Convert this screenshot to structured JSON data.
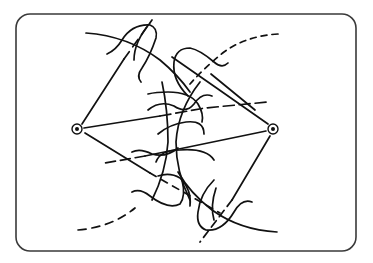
{
  "diagram": {
    "colors": {
      "background": "#ffffff",
      "ink": "#111111",
      "frame": "#3a3a3a"
    },
    "frame": {
      "x": 16,
      "y": 14,
      "width": 340,
      "height": 237,
      "radius": 14
    },
    "pivots": [
      {
        "name": "left-pivot",
        "cx": 77,
        "cy": 129,
        "r_outer": 5,
        "r_inner": 2
      },
      {
        "name": "right-pivot",
        "cx": 273,
        "cy": 129,
        "r_outer": 5,
        "r_inner": 2
      }
    ],
    "lines": [
      {
        "name": "left-upper-radial",
        "d": "M82,124 L124,59",
        "dash": ""
      },
      {
        "name": "left-upper-radial-dashed",
        "d": "M124,59 L152,20",
        "dash": "9 6"
      },
      {
        "name": "left-middle-radial",
        "d": "M84,128 L160,116",
        "dash": ""
      },
      {
        "name": "left-middle-radial-dashed",
        "d": "M160,116 L205,108 L268,102",
        "dash": "11 5"
      },
      {
        "name": "left-lower-radial",
        "d": "M85,133 L150,173",
        "dash": ""
      },
      {
        "name": "left-lower-radial-dashed",
        "d": "M150,173 L220,213",
        "dash": "7 6"
      },
      {
        "name": "right-upper-radial",
        "d": "M268,124 L218,89 L172,57",
        "dash": ""
      },
      {
        "name": "right-middle-radial",
        "d": "M266,131 L145,156",
        "dash": ""
      },
      {
        "name": "right-middle-radial-dashed",
        "d": "M145,156 L105,163",
        "dash": "10 5"
      },
      {
        "name": "right-lower-radial",
        "d": "M270,136 L232,200",
        "dash": ""
      },
      {
        "name": "right-lower-radial-dashed",
        "d": "M232,200 L200,242",
        "dash": "8 5"
      },
      {
        "name": "right-extra-diagonal",
        "d": "M255,110 L211,74",
        "dash": ""
      }
    ],
    "arcs": [
      {
        "name": "left-top-arc",
        "d": "M86,33 Q128,36 160,60 Q178,75 190,92",
        "dash": ""
      },
      {
        "name": "left-bottom-arc",
        "d": "M78,230 Q112,227 135,208",
        "dash": "8 6"
      },
      {
        "name": "right-top-arc",
        "d": "M278,34 Q246,36 224,52 Q204,68 190,84",
        "dash": "6 5"
      },
      {
        "name": "right-bottom-arc",
        "d": "M277,232 Q240,230 212,210 Q190,193 178,172",
        "dash": ""
      },
      {
        "name": "center-arc-down-left",
        "d": "M162,82 Q168,110 168,142 Q166,172 152,200",
        "dash": ""
      },
      {
        "name": "center-arc-down-right",
        "d": "M200,82 Q178,110 176,142 Q176,172 190,200",
        "dash": ""
      }
    ],
    "waves": [
      {
        "name": "upper-left-hook",
        "d": "M107,54 Q116,50 122,40 Q132,24 150,25 Q158,28 156,38 Q150,56 142,68 Q136,76 141,82",
        "dash": ""
      },
      {
        "name": "upper-left-hook-2",
        "d": "M150,23 Q134,42 134,60",
        "dash": ""
      },
      {
        "name": "upper-right-hook",
        "d": "M228,63 Q222,69 214,62 Q200,50 190,48 Q176,48 174,62 Q172,80 188,96",
        "dash": ""
      },
      {
        "name": "center-wave-1",
        "d": "M148,94 Q156,92 168,92 Q190,92 198,104 Q204,114 202,122",
        "dash": ""
      },
      {
        "name": "center-wave-2",
        "d": "M158,134 Q170,124 186,122 Q204,120 204,134",
        "dash": ""
      },
      {
        "name": "center-wave-3",
        "d": "M156,162 Q160,150 180,150 Q206,148 214,160",
        "dash": ""
      },
      {
        "name": "center-wave-4",
        "d": "M158,176 Q170,172 180,178 Q192,190 190,206",
        "dash": ""
      },
      {
        "name": "lower-left-hook",
        "d": "M132,192 Q140,188 150,196 Q168,210 180,204 Q186,196 182,180",
        "dash": ""
      },
      {
        "name": "lower-right-hook",
        "d": "M252,202 Q242,198 234,212 Q222,232 206,230 Q196,226 198,212 Q200,194 214,180",
        "dash": ""
      },
      {
        "name": "lower-right-hook-2",
        "d": "M216,188 Q210,206 214,220",
        "dash": ""
      },
      {
        "name": "right-mid-wave",
        "d": "M148,110 Q160,100 174,106 Q186,114 194,104 Q202,92 212,96",
        "dash": ""
      },
      {
        "name": "left-mid-wave",
        "d": "M178,148 Q166,158 152,154 Q140,148 132,152",
        "dash": ""
      }
    ]
  }
}
